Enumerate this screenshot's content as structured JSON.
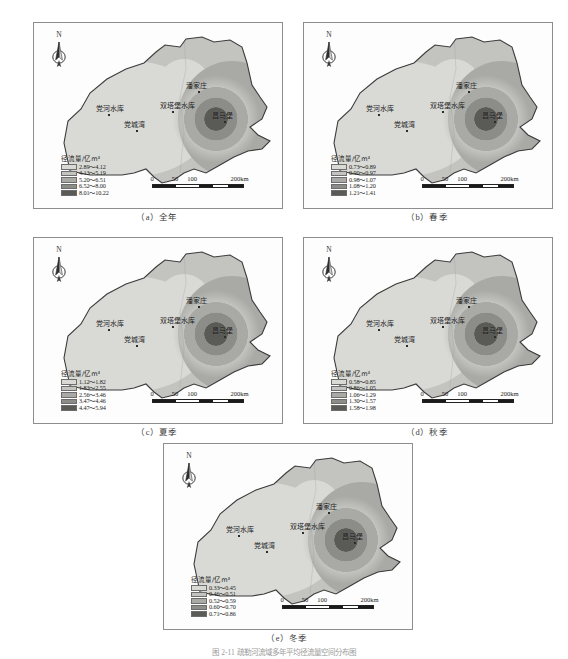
{
  "figure": {
    "caption": "图 2-11  疏勒河流域多年平均径流量空间分布图",
    "legend_title": "径流量/亿m³",
    "north_label": "N",
    "scale": {
      "ticks": [
        "0",
        "50",
        "100",
        "200km"
      ],
      "tick_positions": [
        0,
        23,
        40,
        86
      ]
    },
    "place_labels": [
      {
        "name": "潘家庄",
        "x": 152,
        "y": 60
      },
      {
        "name": "双塔堡水库",
        "x": 126,
        "y": 80
      },
      {
        "name": "党河水库",
        "x": 62,
        "y": 83
      },
      {
        "name": "党城湾",
        "x": 90,
        "y": 99
      },
      {
        "name": "昌马堡",
        "x": 178,
        "y": 90
      }
    ],
    "ramp": [
      "#d9dad6",
      "#c3c4bf",
      "#a9aaa5",
      "#8c8d88",
      "#5a5b57"
    ]
  },
  "chart_data": {
    "type": "map",
    "title": "疏勒河流域多年平均径流量空间分布图",
    "variable": "径流量",
    "unit": "亿m³",
    "panels": [
      {
        "id": "a",
        "caption": "（a）全年",
        "legend_title": "径流量/亿m³",
        "classes": [
          {
            "label": "2.89～4.12",
            "min": 2.89,
            "max": 4.12,
            "color": "#d9dad6"
          },
          {
            "label": "4.13～5.19",
            "min": 4.13,
            "max": 5.19,
            "color": "#c3c4bf"
          },
          {
            "label": "5.20～6.51",
            "min": 5.2,
            "max": 6.51,
            "color": "#a9aaa5"
          },
          {
            "label": "6.52～8.00",
            "min": 6.52,
            "max": 8.0,
            "color": "#8c8d88"
          },
          {
            "label": "8.01～10.22",
            "min": 8.01,
            "max": 10.22,
            "color": "#5a5b57"
          }
        ]
      },
      {
        "id": "b",
        "caption": "（b）春季",
        "legend_title": "径流量/亿m³",
        "classes": [
          {
            "label": "0.73～0.89",
            "min": 0.73,
            "max": 0.89,
            "color": "#d9dad6"
          },
          {
            "label": "0.90～0.97",
            "min": 0.9,
            "max": 0.97,
            "color": "#c3c4bf"
          },
          {
            "label": "0.98～1.07",
            "min": 0.98,
            "max": 1.07,
            "color": "#a9aaa5"
          },
          {
            "label": "1.08～1.20",
            "min": 1.08,
            "max": 1.2,
            "color": "#8c8d88"
          },
          {
            "label": "1.21～1.41",
            "min": 1.21,
            "max": 1.41,
            "color": "#5a5b57"
          }
        ]
      },
      {
        "id": "c",
        "caption": "（c）夏季",
        "legend_title": "径流量/亿m³",
        "classes": [
          {
            "label": "1.12～1.82",
            "min": 1.12,
            "max": 1.82,
            "color": "#d9dad6"
          },
          {
            "label": "1.83～2.55",
            "min": 1.83,
            "max": 2.55,
            "color": "#c3c4bf"
          },
          {
            "label": "2.56～3.46",
            "min": 2.56,
            "max": 3.46,
            "color": "#a9aaa5"
          },
          {
            "label": "3.47～4.46",
            "min": 3.47,
            "max": 4.46,
            "color": "#8c8d88"
          },
          {
            "label": "4.47～5.94",
            "min": 4.47,
            "max": 5.94,
            "color": "#5a5b57"
          }
        ]
      },
      {
        "id": "d",
        "caption": "（d）秋季",
        "legend_title": "径流量/亿m³",
        "classes": [
          {
            "label": "0.58～0.85",
            "min": 0.58,
            "max": 0.85,
            "color": "#d9dad6"
          },
          {
            "label": "0.86～1.05",
            "min": 0.86,
            "max": 1.05,
            "color": "#c3c4bf"
          },
          {
            "label": "1.06～1.29",
            "min": 1.06,
            "max": 1.29,
            "color": "#a9aaa5"
          },
          {
            "label": "1.30～1.57",
            "min": 1.3,
            "max": 1.57,
            "color": "#8c8d88"
          },
          {
            "label": "1.58～1.98",
            "min": 1.58,
            "max": 1.98,
            "color": "#5a5b57"
          }
        ]
      },
      {
        "id": "e",
        "caption": "（e）冬季",
        "legend_title": "径流量/亿m³",
        "classes": [
          {
            "label": "0.33～0.45",
            "min": 0.33,
            "max": 0.45,
            "color": "#d9dad6"
          },
          {
            "label": "0.46～0.51",
            "min": 0.46,
            "max": 0.51,
            "color": "#c3c4bf"
          },
          {
            "label": "0.52～0.59",
            "min": 0.52,
            "max": 0.59,
            "color": "#a9aaa5"
          },
          {
            "label": "0.60～0.70",
            "min": 0.6,
            "max": 0.7,
            "color": "#8c8d88"
          },
          {
            "label": "0.71～0.86",
            "min": 0.71,
            "max": 0.86,
            "color": "#5a5b57"
          }
        ]
      }
    ]
  }
}
